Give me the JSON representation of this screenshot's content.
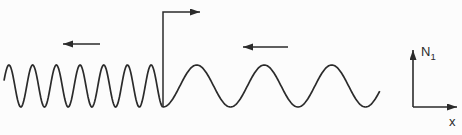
{
  "diagram": {
    "type": "wave-propagation-diagram",
    "background_color": "#fcfcfc",
    "line_color": "#2b2b2b",
    "labels": {
      "vertical_axis": "N",
      "vertical_axis_subscript": "1",
      "horizontal_axis": "x"
    },
    "waves": [
      {
        "id": "short-wavelength-wave",
        "direction": "leftward",
        "x_start": 4,
        "x_end": 163,
        "wavelength_px": 23.7,
        "midline_y": 86,
        "amplitude_px": 21,
        "trough_at_x": 163
      },
      {
        "id": "long-wavelength-wave",
        "direction": "leftward",
        "x_start": 163,
        "x_end": 380,
        "wavelength_px": 67.5,
        "midline_y": 86,
        "amplitude_px": 21,
        "trough_at_x": 163
      }
    ],
    "direction_arrows": [
      {
        "id": "short-wave-direction-arrow",
        "x_tail": 100,
        "x_tip": 63,
        "y": 44
      },
      {
        "id": "long-wave-direction-arrow",
        "x_tail": 288,
        "x_tip": 243,
        "y": 47
      }
    ],
    "interface_marker": {
      "x": 163,
      "y_bottom": 107,
      "y_top": 12,
      "arrow_tip_x": 200
    },
    "axes": {
      "origin_x": 413,
      "origin_y": 107,
      "y_axis_tip_y": 50,
      "x_axis_tip_x": 457
    }
  }
}
